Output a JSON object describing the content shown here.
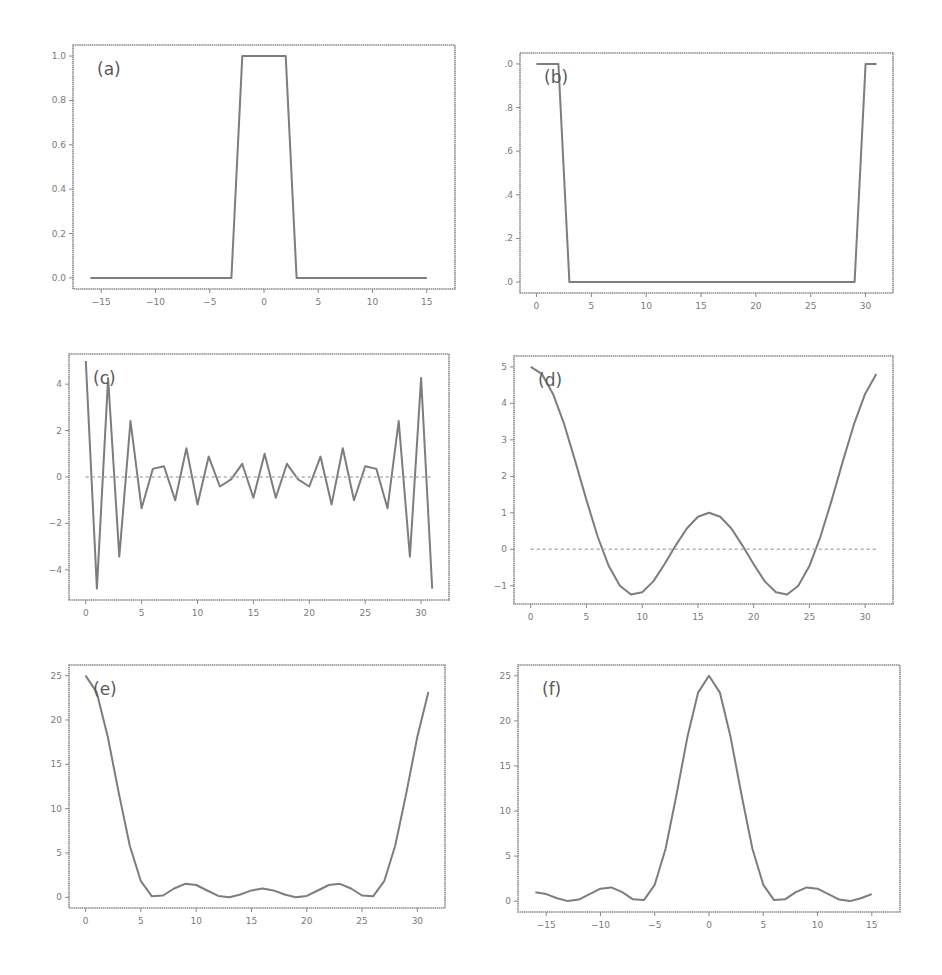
{
  "figure": {
    "background": "#ffffff",
    "line_color": "#7d7d7d",
    "frame_color": "#8a8a8a"
  },
  "chart_data": [
    {
      "id": "a",
      "label": "(a)",
      "type": "line",
      "title": "",
      "xlabel": "",
      "ylabel": "",
      "frame": {
        "left": 73,
        "top": 45,
        "right": 455,
        "bottom": 289
      },
      "xlim": [
        -17.6,
        17.6
      ],
      "ylim": [
        -0.05,
        1.05
      ],
      "xticks": [
        -15,
        -10,
        -5,
        0,
        5,
        10,
        15
      ],
      "xtick_labels": [
        "−15",
        "−10",
        "−5",
        "0",
        "5",
        "10",
        "15"
      ],
      "yticks": [
        0.0,
        0.2,
        0.4,
        0.6,
        0.8,
        1.0
      ],
      "ytick_labels": [
        "0.0",
        "0.2",
        "0.4",
        "0.6",
        "0.8",
        "1.0"
      ],
      "grid": false,
      "series": [
        {
          "name": "rect",
          "x": [
            -16,
            -15,
            -14,
            -13,
            -12,
            -11,
            -10,
            -9,
            -8,
            -7,
            -6,
            -5,
            -4,
            -3,
            -2,
            -1,
            0,
            1,
            2,
            3,
            4,
            5,
            6,
            7,
            8,
            9,
            10,
            11,
            12,
            13,
            14,
            15
          ],
          "values": [
            0,
            0,
            0,
            0,
            0,
            0,
            0,
            0,
            0,
            0,
            0,
            0,
            0,
            0,
            1,
            1,
            1,
            1,
            1,
            0,
            0,
            0,
            0,
            0,
            0,
            0,
            0,
            0,
            0,
            0,
            0,
            0
          ]
        }
      ],
      "zero_line": false
    },
    {
      "id": "b",
      "label": "(b)",
      "type": "line",
      "title": "",
      "xlabel": "",
      "ylabel": "",
      "frame": {
        "left": 520,
        "top": 53,
        "right": 893,
        "bottom": 293
      },
      "xlim": [
        -1.5,
        32.5
      ],
      "ylim": [
        -0.05,
        1.05
      ],
      "xticks": [
        0,
        5,
        10,
        15,
        20,
        25,
        30
      ],
      "xtick_labels": [
        "0",
        "5",
        "10",
        "15",
        "20",
        "25",
        "30"
      ],
      "yticks": [
        0.0,
        0.2,
        0.4,
        0.6,
        0.8,
        1.0
      ],
      "ytick_labels": [
        ".0",
        ".2",
        ".4",
        ".6",
        ".8",
        ".0"
      ],
      "grid": false,
      "series": [
        {
          "name": "shifted rect",
          "x": [
            0,
            1,
            2,
            3,
            4,
            5,
            6,
            7,
            8,
            9,
            10,
            11,
            12,
            13,
            14,
            15,
            16,
            17,
            18,
            19,
            20,
            21,
            22,
            23,
            24,
            25,
            26,
            27,
            28,
            29,
            30,
            31
          ],
          "values": [
            1,
            1,
            1,
            0,
            0,
            0,
            0,
            0,
            0,
            0,
            0,
            0,
            0,
            0,
            0,
            0,
            0,
            0,
            0,
            0,
            0,
            0,
            0,
            0,
            0,
            0,
            0,
            0,
            0,
            0,
            1,
            1
          ]
        }
      ],
      "zero_line": false
    },
    {
      "id": "c",
      "label": "(c)",
      "type": "line",
      "title": "",
      "xlabel": "",
      "ylabel": "",
      "frame": {
        "left": 69,
        "top": 354,
        "right": 449,
        "bottom": 600
      },
      "xlim": [
        -1.5,
        32.5
      ],
      "ylim": [
        -5.3,
        5.3
      ],
      "xticks": [
        0,
        5,
        10,
        15,
        20,
        25,
        30
      ],
      "xtick_labels": [
        "0",
        "5",
        "10",
        "15",
        "20",
        "25",
        "30"
      ],
      "yticks": [
        -4,
        -2,
        0,
        2,
        4
      ],
      "ytick_labels": [
        "−4",
        "−2",
        "0",
        "2",
        "4"
      ],
      "grid": false,
      "series": [
        {
          "name": "real",
          "x": [
            0,
            1,
            2,
            3,
            4,
            5,
            6,
            7,
            8,
            9,
            10,
            11,
            12,
            13,
            14,
            15,
            16,
            17,
            18,
            19,
            20,
            21,
            22,
            23,
            24,
            25,
            26,
            27,
            28,
            29,
            30,
            31
          ],
          "values": [
            5.0,
            -4.81,
            4.26,
            -3.43,
            2.41,
            -1.35,
            0.35,
            0.46,
            -1.0,
            1.24,
            -1.18,
            0.88,
            -0.41,
            -0.1,
            0.57,
            -0.89,
            1.0,
            -0.89,
            0.57,
            -0.1,
            -0.41,
            0.88,
            -1.18,
            1.24,
            -1.0,
            0.46,
            0.35,
            -1.35,
            2.41,
            -3.43,
            4.26,
            -4.81
          ]
        },
        {
          "name": "imag",
          "style": "dashed",
          "x": [
            0,
            31
          ],
          "values": [
            0,
            0
          ]
        }
      ],
      "zero_line": true
    },
    {
      "id": "d",
      "label": "(d)",
      "type": "line",
      "title": "",
      "xlabel": "",
      "ylabel": "",
      "frame": {
        "left": 514,
        "top": 356,
        "right": 893,
        "bottom": 604
      },
      "xlim": [
        -1.5,
        32.5
      ],
      "ylim": [
        -1.5,
        5.3
      ],
      "xticks": [
        0,
        5,
        10,
        15,
        20,
        25,
        30
      ],
      "xtick_labels": [
        "0",
        "5",
        "10",
        "15",
        "20",
        "25",
        "30"
      ],
      "yticks": [
        -1,
        0,
        1,
        2,
        3,
        4,
        5
      ],
      "ytick_labels": [
        "−1",
        "0",
        "1",
        "2",
        "3",
        "4",
        "5"
      ],
      "grid": false,
      "series": [
        {
          "name": "real",
          "x": [
            0,
            1,
            2,
            3,
            4,
            5,
            6,
            7,
            8,
            9,
            10,
            11,
            12,
            13,
            14,
            15,
            16,
            17,
            18,
            19,
            20,
            21,
            22,
            23,
            24,
            25,
            26,
            27,
            28,
            29,
            30,
            31
          ],
          "values": [
            5.0,
            4.81,
            4.26,
            3.43,
            2.41,
            1.35,
            0.35,
            -0.46,
            -1.0,
            -1.24,
            -1.18,
            -0.88,
            -0.41,
            0.1,
            0.57,
            0.89,
            1.0,
            0.89,
            0.57,
            0.1,
            -0.41,
            -0.88,
            -1.18,
            -1.24,
            -1.0,
            -0.46,
            0.35,
            1.35,
            2.41,
            3.43,
            4.26,
            4.81
          ]
        },
        {
          "name": "imag",
          "style": "dashed",
          "x": [
            0,
            31
          ],
          "values": [
            0,
            0
          ]
        }
      ],
      "zero_line": true
    },
    {
      "id": "e",
      "label": "(e)",
      "type": "line",
      "title": "",
      "xlabel": "",
      "ylabel": "",
      "frame": {
        "left": 69,
        "top": 665,
        "right": 445,
        "bottom": 908
      },
      "xlim": [
        -1.5,
        32.5
      ],
      "ylim": [
        -1.2,
        26.2
      ],
      "xticks": [
        0,
        5,
        10,
        15,
        20,
        25,
        30
      ],
      "xtick_labels": [
        "0",
        "5",
        "10",
        "15",
        "20",
        "25",
        "30"
      ],
      "yticks": [
        0,
        5,
        10,
        15,
        20,
        25
      ],
      "ytick_labels": [
        "0",
        "5",
        "10",
        "15",
        "20",
        "25"
      ],
      "grid": false,
      "series": [
        {
          "name": "power",
          "x": [
            0,
            1,
            2,
            3,
            4,
            5,
            6,
            7,
            8,
            9,
            10,
            11,
            12,
            13,
            14,
            15,
            16,
            17,
            18,
            19,
            20,
            21,
            22,
            23,
            24,
            25,
            26,
            27,
            28,
            29,
            30,
            31
          ],
          "values": [
            25.0,
            23.14,
            18.15,
            11.76,
            5.81,
            1.82,
            0.12,
            0.21,
            1.0,
            1.53,
            1.39,
            0.77,
            0.17,
            0.01,
            0.32,
            0.79,
            1.0,
            0.79,
            0.32,
            0.01,
            0.17,
            0.77,
            1.39,
            1.53,
            1.0,
            0.21,
            0.12,
            1.82,
            5.81,
            11.76,
            18.15,
            23.14
          ]
        }
      ],
      "zero_line": false
    },
    {
      "id": "f",
      "label": "(f)",
      "type": "line",
      "title": "",
      "xlabel": "",
      "ylabel": "",
      "frame": {
        "left": 518,
        "top": 665,
        "right": 900,
        "bottom": 912
      },
      "xlim": [
        -17.6,
        17.6
      ],
      "ylim": [
        -1.2,
        26.2
      ],
      "xticks": [
        -15,
        -10,
        -5,
        0,
        5,
        10,
        15
      ],
      "xtick_labels": [
        "−15",
        "−10",
        "−5",
        "0",
        "5",
        "10",
        "15"
      ],
      "yticks": [
        0,
        5,
        10,
        15,
        20,
        25
      ],
      "ytick_labels": [
        "0",
        "5",
        "10",
        "15",
        "20",
        "25"
      ],
      "grid": false,
      "series": [
        {
          "name": "shifted power",
          "x": [
            -16,
            -15,
            -14,
            -13,
            -12,
            -11,
            -10,
            -9,
            -8,
            -7,
            -6,
            -5,
            -4,
            -3,
            -2,
            -1,
            0,
            1,
            2,
            3,
            4,
            5,
            6,
            7,
            8,
            9,
            10,
            11,
            12,
            13,
            14,
            15
          ],
          "values": [
            1.0,
            0.79,
            0.32,
            0.01,
            0.17,
            0.77,
            1.39,
            1.53,
            1.0,
            0.21,
            0.12,
            1.82,
            5.81,
            11.76,
            18.15,
            23.14,
            25.0,
            23.14,
            18.15,
            11.76,
            5.81,
            1.82,
            0.12,
            0.21,
            1.0,
            1.53,
            1.39,
            0.77,
            0.17,
            0.01,
            0.32,
            0.79
          ]
        }
      ],
      "zero_line": false
    }
  ]
}
